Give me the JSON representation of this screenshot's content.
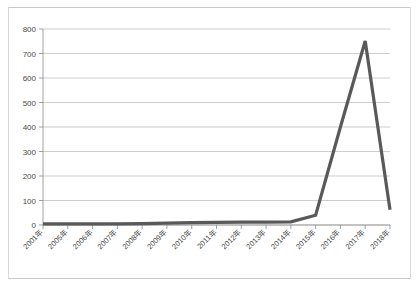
{
  "chart_data": {
    "type": "line",
    "title": "",
    "subtitle": "",
    "xlabel": "",
    "ylabel": "",
    "categories": [
      "2001年",
      "2005年",
      "2006年",
      "2007年",
      "2008年",
      "2009年",
      "2010年",
      "2011年",
      "2012年",
      "2013年",
      "2014年",
      "2015年",
      "2016年",
      "2017年",
      "2018年"
    ],
    "values": [
      5,
      5,
      5,
      5,
      6,
      8,
      10,
      11,
      12,
      12,
      13,
      40,
      400,
      751,
      62
    ],
    "series": [
      {
        "name": "",
        "values": [
          5,
          5,
          5,
          5,
          6,
          8,
          10,
          11,
          12,
          12,
          13,
          40,
          400,
          751,
          62
        ],
        "color": "#595959"
      }
    ],
    "ylim": [
      0,
      800
    ],
    "ytick_labels": [
      "0",
      "100",
      "200",
      "300",
      "400",
      "500",
      "600",
      "700",
      "800"
    ],
    "ytick_values": [
      0,
      100,
      200,
      300,
      400,
      500,
      600,
      700,
      800
    ],
    "grid": true,
    "grid_axis": "y",
    "legend": false,
    "legend_position": "none"
  },
  "style": {
    "line_color": "#595959",
    "grid_color": "#b7b7b7",
    "axis_color": "#8a8a8a",
    "text_color": "#4a4a4a",
    "background": "#ffffff",
    "frame_color": "#c9c9c9"
  }
}
